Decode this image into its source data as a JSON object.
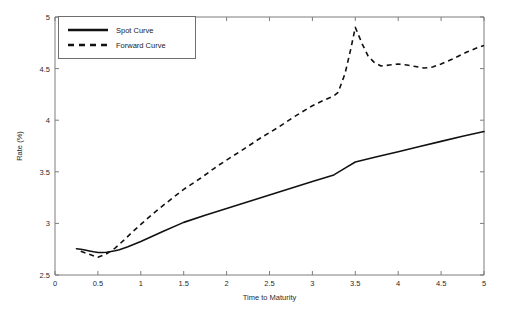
{
  "chart_data": {
    "type": "line",
    "title": "",
    "xlabel": "Time to Maturity",
    "ylabel": "Rate (%)",
    "xlim": [
      0,
      5
    ],
    "ylim": [
      2.5,
      5
    ],
    "xticks": [
      0,
      0.5,
      1,
      1.5,
      2,
      2.5,
      3,
      3.5,
      4,
      4.5,
      5
    ],
    "xtick_labels": [
      "0",
      "0.5",
      "1",
      "1.5",
      "2",
      "2.5",
      "3",
      "3.5",
      "4",
      "4.5",
      "5"
    ],
    "yticks": [
      2.5,
      3,
      3.5,
      4,
      4.5,
      5
    ],
    "ytick_labels": [
      "2.5",
      "3",
      "3.5",
      "4",
      "4.5",
      "5"
    ],
    "grid": false,
    "legend_position": "upper left",
    "series": [
      {
        "name": "Spot Curve",
        "style": "solid",
        "color": "#111111",
        "x": [
          0.25,
          0.3,
          0.35,
          0.4,
          0.45,
          0.5,
          0.55,
          0.6,
          0.65,
          0.7,
          0.75,
          0.85,
          1.0,
          1.25,
          1.5,
          1.75,
          2.0,
          2.25,
          2.5,
          2.75,
          3.0,
          3.25,
          3.4,
          3.5,
          3.75,
          4.0,
          4.25,
          4.5,
          4.75,
          5.0
        ],
        "values": [
          2.755,
          2.75,
          2.742,
          2.733,
          2.725,
          2.718,
          2.718,
          2.721,
          2.727,
          2.735,
          2.745,
          2.773,
          2.825,
          2.92,
          3.01,
          3.08,
          3.145,
          3.21,
          3.275,
          3.34,
          3.405,
          3.47,
          3.545,
          3.595,
          3.645,
          3.695,
          3.745,
          3.795,
          3.845,
          3.89
        ]
      },
      {
        "name": "Forward Curve",
        "style": "dashed",
        "color": "#111111",
        "x": [
          0.3,
          0.4,
          0.5,
          0.6,
          0.7,
          0.8,
          0.9,
          1.0,
          1.15,
          1.3,
          1.5,
          1.7,
          1.9,
          2.05,
          2.2,
          2.4,
          2.6,
          2.8,
          3.0,
          3.15,
          3.25,
          3.3,
          3.38,
          3.45,
          3.5,
          3.58,
          3.65,
          3.72,
          3.8,
          3.9,
          4.0,
          4.1,
          4.2,
          4.3,
          4.4,
          4.5,
          4.6,
          4.7,
          4.8,
          4.9,
          5.0
        ],
        "values": [
          2.73,
          2.7,
          2.672,
          2.705,
          2.76,
          2.835,
          2.915,
          2.99,
          3.1,
          3.2,
          3.33,
          3.44,
          3.56,
          3.64,
          3.72,
          3.83,
          3.93,
          4.04,
          4.14,
          4.2,
          4.235,
          4.27,
          4.45,
          4.7,
          4.9,
          4.74,
          4.62,
          4.56,
          4.525,
          4.535,
          4.545,
          4.535,
          4.52,
          4.505,
          4.515,
          4.545,
          4.58,
          4.62,
          4.66,
          4.695,
          4.725
        ]
      }
    ]
  },
  "legend": {
    "entries": [
      {
        "label": "Spot Curve",
        "style": "solid"
      },
      {
        "label": "Forward Curve",
        "style": "dashed"
      }
    ]
  }
}
